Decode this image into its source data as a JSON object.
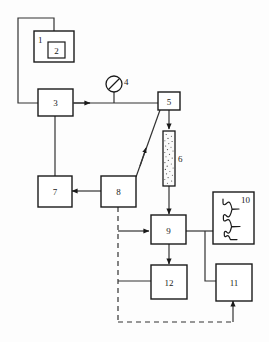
{
  "diagram": {
    "background_color": "#fdfdfd",
    "line_color": "#333333",
    "stroke_color": "#1a1a1a",
    "nodes": [
      {
        "id": "1",
        "label": "1",
        "name": "box-1-outer",
        "shape": "rect"
      },
      {
        "id": "2",
        "label": "2",
        "name": "box-2-inner",
        "shape": "rect"
      },
      {
        "id": "3",
        "label": "3",
        "name": "box-3",
        "shape": "rect"
      },
      {
        "id": "4",
        "label": "4",
        "name": "gauge-4",
        "shape": "circle-gauge"
      },
      {
        "id": "5",
        "label": "5",
        "name": "box-5",
        "shape": "rect"
      },
      {
        "id": "6",
        "label": "6",
        "name": "column-6",
        "shape": "packed-column"
      },
      {
        "id": "7",
        "label": "7",
        "name": "box-7",
        "shape": "rect"
      },
      {
        "id": "8",
        "label": "8",
        "name": "box-8",
        "shape": "rect"
      },
      {
        "id": "9",
        "label": "9",
        "name": "box-9",
        "shape": "rect"
      },
      {
        "id": "10",
        "label": "10",
        "name": "box-10-recorder",
        "shape": "rect-with-trace"
      },
      {
        "id": "11",
        "label": "11",
        "name": "box-11",
        "shape": "rect"
      },
      {
        "id": "12",
        "label": "12",
        "name": "box-12",
        "shape": "rect"
      }
    ],
    "connections": [
      {
        "name": "conn-1-to-3",
        "from": "1",
        "to": "3",
        "style": "solid",
        "arrow": false
      },
      {
        "name": "conn-3-to-5",
        "from": "3",
        "to": "5",
        "style": "solid",
        "arrow": true
      },
      {
        "name": "conn-gauge-4-tap",
        "from": "4",
        "to": "3",
        "style": "solid",
        "arrow": false
      },
      {
        "name": "conn-5-to-6",
        "from": "5",
        "to": "6",
        "style": "solid",
        "arrow": true
      },
      {
        "name": "conn-6-to-9",
        "from": "6",
        "to": "9",
        "style": "solid",
        "arrow": true
      },
      {
        "name": "conn-3-to-7",
        "from": "3",
        "to": "7",
        "style": "solid",
        "arrow": false
      },
      {
        "name": "conn-8-to-7",
        "from": "8",
        "to": "7",
        "style": "solid",
        "arrow": true
      },
      {
        "name": "conn-8-to-5",
        "from": "8",
        "to": "5",
        "style": "solid",
        "arrow": true
      },
      {
        "name": "conn-8-to-9",
        "from": "8",
        "to": "9",
        "style": "solid",
        "arrow": true
      },
      {
        "name": "conn-8-to-12",
        "from": "8",
        "to": "12",
        "style": "solid",
        "arrow": false
      },
      {
        "name": "conn-9-to-12",
        "from": "9",
        "to": "12",
        "style": "solid",
        "arrow": true
      },
      {
        "name": "conn-9-to-10",
        "from": "9",
        "to": "10",
        "style": "solid",
        "arrow": false
      },
      {
        "name": "conn-9-to-11",
        "from": "9",
        "to": "11",
        "style": "solid",
        "arrow": false
      },
      {
        "name": "conn-8-to-11-dashed",
        "from": "8",
        "to": "11",
        "style": "dashed",
        "arrow": true
      }
    ],
    "recorder_trace": {
      "name": "chromatogram-trace",
      "description": "vertical baseline with peaks extending to the right",
      "peaks": 4
    }
  }
}
